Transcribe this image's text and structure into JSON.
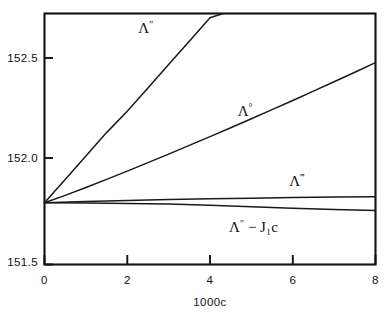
{
  "figure": {
    "background_color": "#ffffff",
    "line_color": "#1a1a1a",
    "axis_color": "#111111"
  },
  "axes": {
    "x_title": "1000c",
    "y_title": "",
    "x_ticks": [
      "0",
      "2",
      "4",
      "6",
      "8"
    ],
    "y_ticks": [
      "152.5",
      "152.0",
      "151.5"
    ]
  },
  "curve_labels": {
    "lambda_double_prime": "Λ″",
    "lambda_naught": "Λ°",
    "lambda_triple_prime": "Λ‴",
    "lambda_minus_j1c": "Λ″ − J₁c"
  },
  "chart_data": {
    "type": "line",
    "title": "",
    "xlabel": "1000c",
    "ylabel": "",
    "xlim": [
      0,
      8
    ],
    "ylim": [
      151.5,
      152.68
    ],
    "xticks": [
      0,
      2,
      4,
      6,
      8
    ],
    "yticks": [
      151.5,
      152.0,
      152.5
    ],
    "grid": false,
    "legend": "inline-annotations",
    "series": [
      {
        "name": "Λ″",
        "label_position": {
          "x": 2.45,
          "y": 152.59
        },
        "clipped_at_top": true,
        "x": [
          0,
          0.5,
          1,
          1.5,
          2,
          2.5,
          3,
          3.5,
          4,
          4.32
        ],
        "y": [
          151.79,
          151.9,
          152.01,
          152.12,
          152.22,
          152.33,
          152.44,
          152.55,
          152.66,
          152.68
        ]
      },
      {
        "name": "Λ°",
        "label_position": {
          "x": 4.85,
          "y": 152.2
        },
        "clipped_at_top": false,
        "x": [
          0,
          0.5,
          1,
          1.5,
          2,
          2.5,
          3,
          3.5,
          4,
          4.5,
          5,
          5.5,
          6,
          6.5,
          7,
          7.5,
          8
        ],
        "y": [
          151.79,
          151.825,
          151.862,
          151.9,
          151.939,
          151.979,
          152.019,
          152.06,
          152.101,
          152.143,
          152.185,
          152.228,
          152.271,
          152.315,
          152.359,
          152.404,
          152.449
        ]
      },
      {
        "name": "Λ‴",
        "label_position": {
          "x": 6.1,
          "y": 151.87
        },
        "clipped_at_top": false,
        "x": [
          0,
          1,
          2,
          3,
          4,
          5,
          6,
          7,
          8
        ],
        "y": [
          151.79,
          151.796,
          151.801,
          151.805,
          151.809,
          151.812,
          151.815,
          151.817,
          151.819
        ]
      },
      {
        "name": "Λ″ − J₁c",
        "label_position": {
          "x": 5.05,
          "y": 151.655
        },
        "clipped_at_top": false,
        "x": [
          0,
          1,
          2,
          3,
          4,
          5,
          6,
          7,
          8
        ],
        "y": [
          151.79,
          151.789,
          151.787,
          151.784,
          151.779,
          151.772,
          151.764,
          151.758,
          151.754
        ]
      }
    ]
  }
}
